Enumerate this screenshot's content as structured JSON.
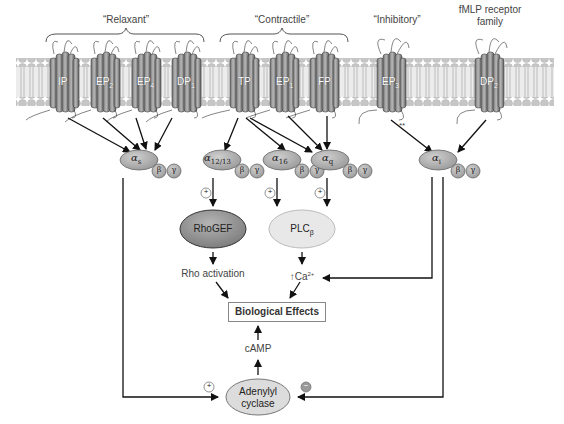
{
  "groups": {
    "relaxant": "“Relaxant”",
    "contractile": "“Contractile”",
    "inhibitory": "“Inhibitory”",
    "fmlp_line1": "fMLP receptor",
    "fmlp_line2": "family"
  },
  "receptors": [
    {
      "name": "IP",
      "sub": ""
    },
    {
      "name": "EP",
      "sub": "2"
    },
    {
      "name": "EP",
      "sub": "4"
    },
    {
      "name": "DP",
      "sub": "1"
    },
    {
      "name": "TP",
      "sub": ""
    },
    {
      "name": "EP",
      "sub": "1"
    },
    {
      "name": "FP",
      "sub": ""
    },
    {
      "name": "EP",
      "sub": "3"
    },
    {
      "name": "DP",
      "sub": "2"
    }
  ],
  "gproteins": {
    "gs": {
      "alpha": "α",
      "sub": "s"
    },
    "g1213": {
      "alpha": "α",
      "sub": "12/13"
    },
    "g16": {
      "alpha": "α",
      "sub": "16"
    },
    "gq": {
      "alpha": "α",
      "sub": "q"
    },
    "gi": {
      "alpha": "α",
      "sub": "i"
    },
    "beta": "β",
    "gamma": "γ"
  },
  "effectors": {
    "rhogef": "RhoGEF",
    "plc": "PLC",
    "plc_sub": "β",
    "rho_activation": "Rho activation",
    "ca_arrow": "↑",
    "ca": "Ca",
    "ca_sup": "2+",
    "bio_effects": "Biological Effects",
    "camp": "cAMP",
    "ac_line1": "Adenylyl",
    "ac_line2": "cyclase"
  },
  "signs": {
    "plus": "+",
    "minus": "−"
  },
  "annotations": {
    "double_star": "**"
  },
  "colors": {
    "membrane_head": "#c9c9c9",
    "membrane_tail": "#e2e2e2",
    "receptor": "#8a8a8a",
    "galpha": "#b5b5b5",
    "rhogef": "#9a9a9a",
    "plc": "#e6e6e6",
    "ac": "#dcdcdc"
  }
}
